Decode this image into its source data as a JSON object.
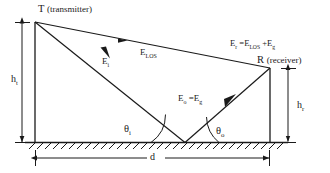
{
  "figure": {
    "background_color": "#ffffff",
    "line_color": "#1a1a1a",
    "text_color": "#1a1a1a"
  },
  "nodes": {
    "transmitter": {
      "symbol": "T",
      "paren": "(transmitter)",
      "x": 35,
      "y": 22
    },
    "receiver": {
      "symbol": "R",
      "paren": "(receiver)",
      "x": 270,
      "y": 68
    },
    "reflection_point": {
      "x": 185,
      "y": 142
    }
  },
  "rays": {
    "line_of_sight": {
      "label_main": "E",
      "label_sub": "LOS",
      "from": "transmitter",
      "to": "receiver"
    },
    "incident": {
      "label_main": "E",
      "label_sub": "i",
      "from": "transmitter",
      "to": "reflection_point"
    },
    "reflected": {
      "label_main": "E",
      "label_sub": "o",
      "equals": "=",
      "rhs_main": "E",
      "rhs_sub": "g",
      "from": "reflection_point",
      "to": "receiver"
    }
  },
  "equation": {
    "lhs_main": "E",
    "lhs_sub": "r",
    "equals": "=",
    "term1_main": "E",
    "term1_sub": "LOS",
    "plus": "+",
    "term2_main": "E",
    "term2_sub": "g"
  },
  "angles": {
    "incidence": {
      "main": "θ",
      "sub": "i"
    },
    "reflection": {
      "main": "θ",
      "sub": "o"
    }
  },
  "dimensions": {
    "height_transmitter": {
      "main": "h",
      "sub": "t"
    },
    "height_receiver": {
      "main": "h",
      "sub": "r"
    },
    "separation": {
      "main": "d",
      "sub": ""
    }
  },
  "ground": {
    "name": "hatched-ground-surface",
    "y": 142,
    "x_start": 25,
    "x_end": 288
  }
}
